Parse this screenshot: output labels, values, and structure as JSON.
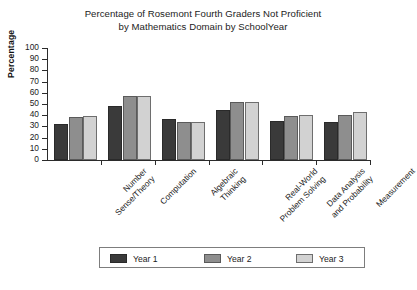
{
  "chart_data": {
    "type": "bar",
    "title": "Percentage of Rosemont Fourth Graders Not Proficient by Mathematics Domain by SchoolYear",
    "title_lines": [
      "Percentage of Rosemont Fourth Graders Not Proficient",
      "by Mathematics Domain by SchoolYear"
    ],
    "xlabel": "",
    "ylabel": "Percentage",
    "ylim": [
      0,
      100
    ],
    "ytick_step": 10,
    "yticks": [
      100,
      90,
      80,
      70,
      60,
      50,
      40,
      30,
      20,
      10,
      0
    ],
    "ytick_labels": [
      "100",
      "90",
      "80",
      "70",
      "60",
      "50",
      "40",
      "30",
      "20",
      "10",
      "0"
    ],
    "grid": false,
    "legend_position": "bottom",
    "categories": [
      "Number Sense/Theory",
      "Computation",
      "Algebraic Thinking",
      "Real-World Problem Solving",
      "Data Analysis and Probability",
      "Measurement"
    ],
    "category_lines": [
      [
        "Number",
        "Sense/Theory"
      ],
      [
        "Computation",
        ""
      ],
      [
        "Algebraic",
        "Thinking"
      ],
      [
        "Real-World",
        "Problem Solving"
      ],
      [
        "Data Analysis",
        "and Probability"
      ],
      [
        "Measurement",
        ""
      ]
    ],
    "series": [
      {
        "name": "Year 1",
        "color": "#3a3a3a",
        "values": [
          32,
          48,
          37,
          45,
          35,
          34
        ]
      },
      {
        "name": "Year 2",
        "color": "#8e8e8e",
        "values": [
          38,
          57,
          34,
          52,
          39,
          40
        ]
      },
      {
        "name": "Year 3",
        "color": "#d2d2d2",
        "values": [
          39,
          57,
          34,
          52,
          40,
          43
        ]
      }
    ]
  },
  "legend": {
    "entries": [
      {
        "label": "Year 1"
      },
      {
        "label": "Year 2"
      },
      {
        "label": "Year 3"
      }
    ]
  }
}
